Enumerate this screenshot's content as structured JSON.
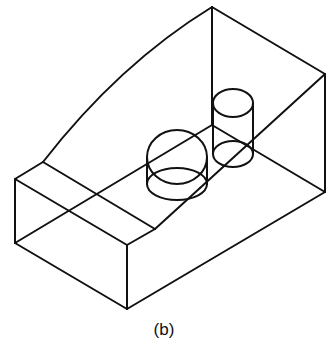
{
  "figure": {
    "caption": "(b)",
    "stroke_color": "#111111",
    "background": "#ffffff"
  }
}
